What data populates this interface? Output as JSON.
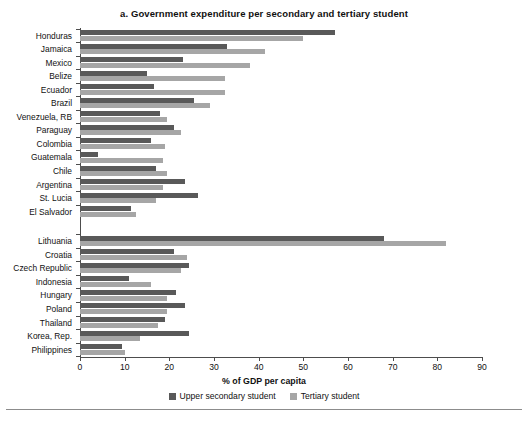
{
  "chart_data": {
    "type": "bar",
    "orientation": "horizontal",
    "title": "a. Government expenditure per secondary and tertiary student",
    "xlabel": "% of GDP per capita",
    "ylabel": "",
    "xlim": [
      0,
      90
    ],
    "xticks": [
      0,
      10,
      20,
      30,
      40,
      50,
      60,
      70,
      80,
      90
    ],
    "grid": false,
    "legend_position": "bottom",
    "group_gap_after": "El Salvador",
    "categories": [
      "Honduras",
      "Jamaica",
      "Mexico",
      "Belize",
      "Ecuador",
      "Brazil",
      "Venezuela, RB",
      "Paraguay",
      "Colombia",
      "Guatemala",
      "Chile",
      "Argentina",
      "St. Lucia",
      "El Salvador",
      "Lithuania",
      "Croatia",
      "Czech Republic",
      "Indonesia",
      "Hungary",
      "Poland",
      "Thailand",
      "Korea, Rep.",
      "Philippines"
    ],
    "series": [
      {
        "name": "Upper secondary student",
        "color": "#595959",
        "values": [
          57,
          33,
          23,
          15,
          16.5,
          25.5,
          18,
          21,
          16,
          4,
          17,
          23.5,
          26.5,
          11.5,
          68,
          21,
          24.5,
          11,
          21.5,
          23.5,
          19,
          24.5,
          9.5
        ]
      },
      {
        "name": "Tertiary student",
        "color": "#a6a6a6",
        "values": [
          50,
          41.5,
          38,
          32.5,
          32.5,
          29,
          19.5,
          22.5,
          19,
          18.5,
          19.5,
          18.5,
          17,
          12.5,
          82,
          24,
          22.5,
          16,
          19.5,
          19.5,
          17.5,
          13.5,
          10
        ]
      }
    ]
  },
  "legend": {
    "entries": [
      {
        "label": "Upper secondary student",
        "swatch": "secondary"
      },
      {
        "label": "Tertiary student",
        "swatch": "tertiary"
      }
    ]
  }
}
